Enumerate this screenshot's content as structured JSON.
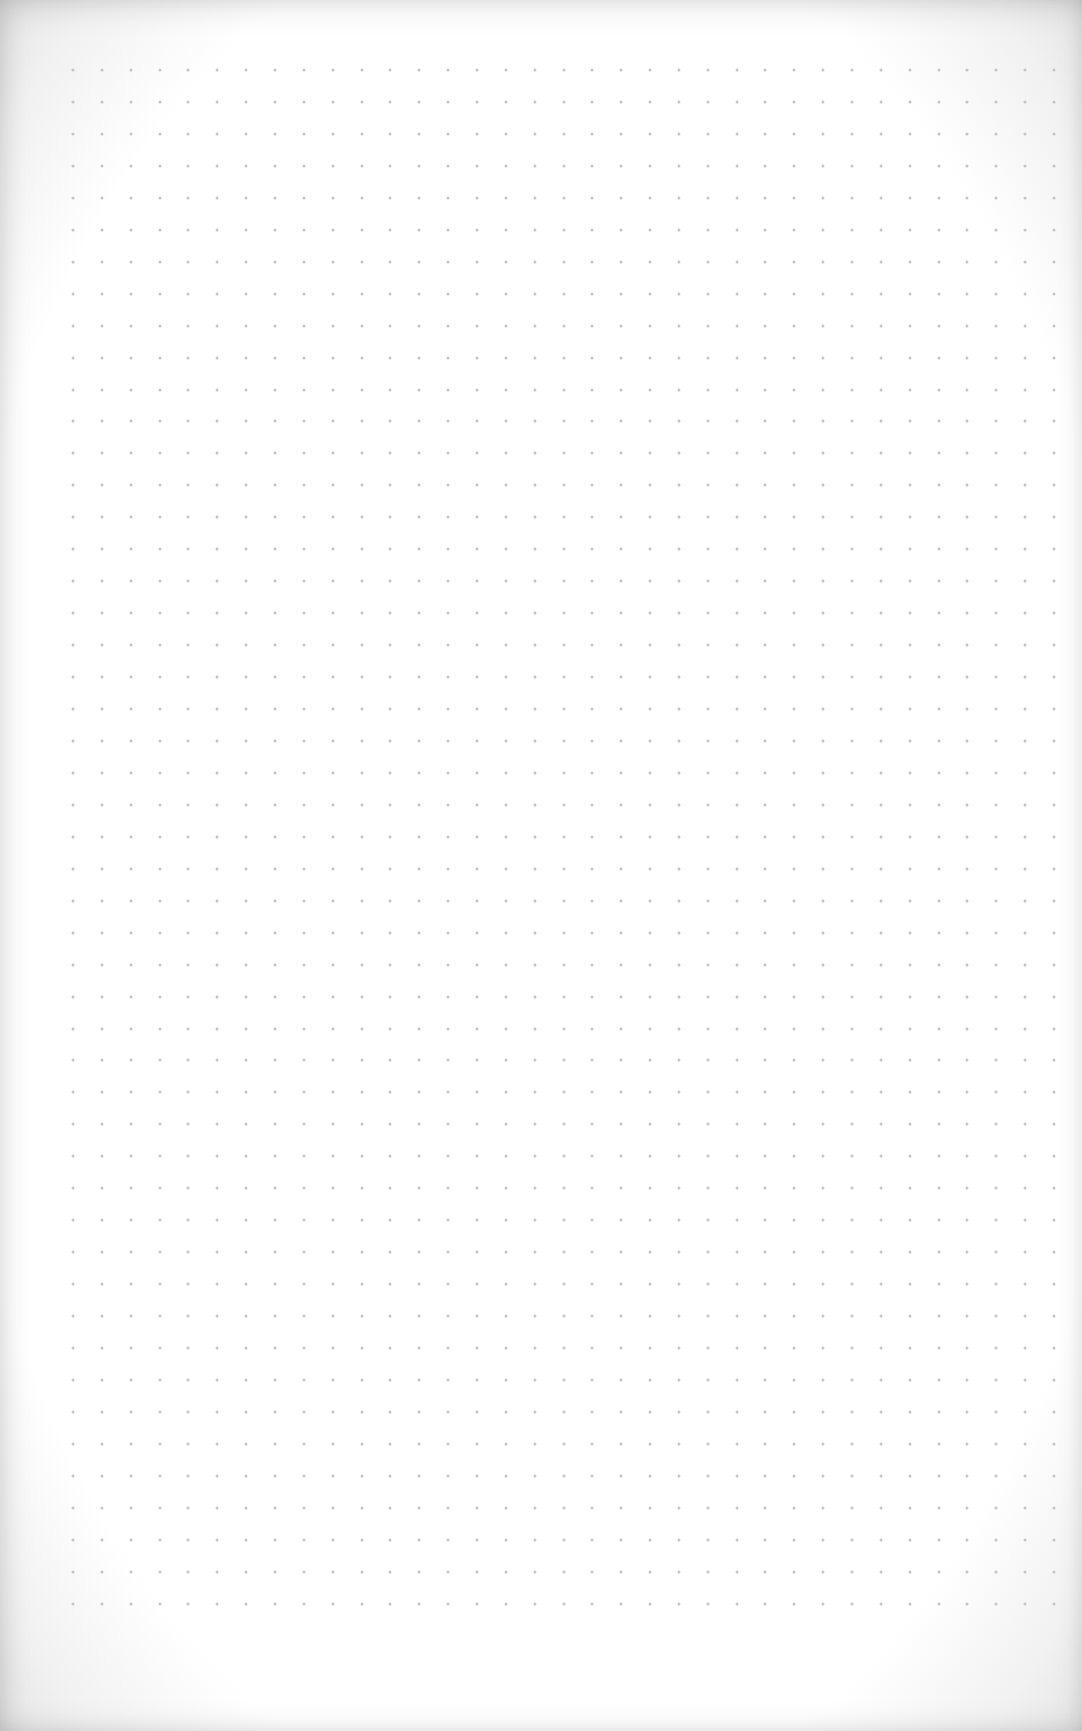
{
  "page": {
    "type": "dot-grid notebook page",
    "background_color": "#ffffff",
    "edge_shade_color": "#e4e4e4"
  },
  "grid": {
    "origin_x": 73,
    "origin_y": 70,
    "spacing_x": 28.85,
    "spacing_y": 31.95,
    "columns": 35,
    "rows": 49,
    "dot_color": "#c4c4c4"
  }
}
